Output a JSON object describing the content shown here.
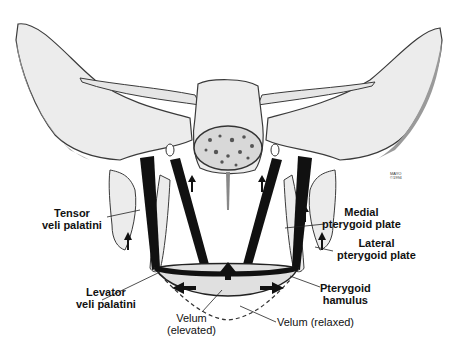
{
  "figure": {
    "signature": [
      "MAYO",
      "©1994"
    ]
  },
  "labels": {
    "tensor": [
      "Tensor",
      "veli palatini"
    ],
    "levator": [
      "Levator",
      "veli palatini"
    ],
    "medial": [
      "Medial",
      "pterygoid plate"
    ],
    "lateral": [
      "Lateral",
      "pterygoid plate"
    ],
    "hamulus": [
      "Pterygoid",
      "hamulus"
    ],
    "velum_elevated": [
      "Velum",
      "(elevated)"
    ],
    "velum_relaxed": "Velum (relaxed)"
  },
  "colors": {
    "bone_fill": "#ececec",
    "bone_outline": "#3a3a3a",
    "muscle": "#111111",
    "shadow": "#8a8a8a"
  }
}
